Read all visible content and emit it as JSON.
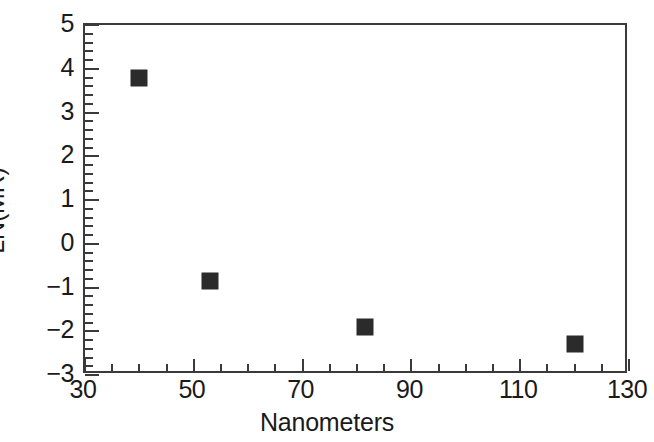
{
  "chart_data": {
    "type": "scatter",
    "title": "",
    "xlabel": "Nanometers",
    "ylabel": "LN(MR)",
    "xlim": [
      30,
      130
    ],
    "ylim": [
      -3,
      5
    ],
    "xticks": [
      30,
      50,
      70,
      90,
      110,
      130
    ],
    "yticks": [
      5,
      4,
      3,
      2,
      1,
      0,
      -1,
      -2,
      -3
    ],
    "xtick_labels": [
      "30",
      "50",
      "70",
      "90",
      "110",
      "130"
    ],
    "ytick_labels": [
      "5",
      "4",
      "3",
      "2",
      "1",
      "0",
      "−1",
      "−2",
      "−3"
    ],
    "x_minor_step": 5,
    "y_minor_step": 0.2,
    "grid": false,
    "legend": null,
    "marker_style": "filled-square",
    "marker_color": "#2b2b2b",
    "axis_color": "#3a3a3a",
    "background_color": "#ffffff",
    "x": [
      40,
      53,
      81.5,
      120
    ],
    "y": [
      3.8,
      -0.85,
      -1.9,
      -2.3
    ],
    "points": [
      {
        "x": 40,
        "y": 3.8,
        "label": "40 nm, LN(MR) 3.8"
      },
      {
        "x": 53,
        "y": -0.85,
        "label": "53 nm, LN(MR) -0.85"
      },
      {
        "x": 81.5,
        "y": -1.9,
        "label": "81.5 nm, LN(MR) -1.9"
      },
      {
        "x": 120,
        "y": -2.3,
        "label": "120 nm, LN(MR) -2.3"
      }
    ]
  }
}
